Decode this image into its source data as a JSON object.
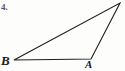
{
  "figure": {
    "marker_label": "4.",
    "background_color": "#fdfdfc",
    "stroke_color": "#1f1f1f",
    "stroke_width": 1.1,
    "width": 125,
    "height": 71
  },
  "chart_data": {
    "type": "diagram",
    "title": "",
    "shape": "triangle",
    "vertices": [
      {
        "name": "B",
        "label": "B",
        "x": 14,
        "y": 60,
        "label_x": 1,
        "label_y": 54
      },
      {
        "name": "A",
        "label": "A",
        "x": 91,
        "y": 59,
        "label_x": 85,
        "label_y": 59
      },
      {
        "name": "apex",
        "label": "",
        "x": 120,
        "y": 3,
        "label_x": null,
        "label_y": null
      }
    ],
    "edges": [
      {
        "from": "B",
        "to": "A",
        "name": "base-edge"
      },
      {
        "from": "B",
        "to": "apex",
        "name": "long-diagonal-edge"
      },
      {
        "from": "A",
        "to": "apex",
        "name": "right-edge"
      }
    ],
    "polygon_points": "14,60 91,59 120,3",
    "labels": [
      "B",
      "A"
    ],
    "xlabel": "",
    "ylabel": ""
  }
}
